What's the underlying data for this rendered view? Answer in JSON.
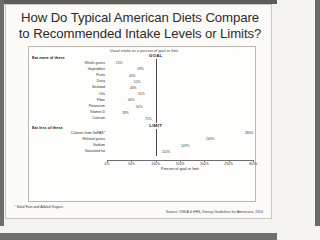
{
  "slide": {
    "title": "How Do Typical American Diets Compare to Recommended Intake Levels or Limits?",
    "axis_caption": "Usual intake as a percent of goal or limit",
    "footnote": "* Solid Fats and Added Sugars",
    "source": "Source: USDA & HHS, Dietary Guidelines for Americans, 2010"
  },
  "chart_data": {
    "type": "bar",
    "title": "How Do Typical American Diets Compare to Recommended Intake Levels or Limits?",
    "subtitle": "Usual intake as a percent of goal or limit",
    "orientation": "horizontal",
    "xlabel": "Percent of goal or limit",
    "ylabel": "",
    "xlim": [
      0,
      300
    ],
    "xticks": [
      0,
      50,
      100,
      150,
      200,
      250,
      300
    ],
    "xticklabels": [
      "0%",
      "50%",
      "100%",
      "150%",
      "200%",
      "250%",
      "300%"
    ],
    "grid": false,
    "legend": "none",
    "groups": [
      {
        "name": "Eat more of these",
        "reference_line": {
          "label": "GOAL",
          "value": 100
        },
        "categories": [
          "Whole grains",
          "Vegetables",
          "Fruits",
          "Dairy",
          "Seafood",
          "Oils",
          "Fiber",
          "Potassium",
          "Vitamin D",
          "Calcium"
        ],
        "values": [
          15,
          59,
          42,
          52,
          44,
          61,
          40,
          56,
          28,
          75
        ],
        "labels": [
          "15%",
          "59%",
          "42%",
          "52%",
          "44%",
          "61%",
          "40%",
          "56%",
          "28%",
          "75%"
        ]
      },
      {
        "name": "Eat less of these",
        "reference_line": {
          "label": "LIMIT",
          "value": 100
        },
        "categories": [
          "Calories from SoFAS*",
          "Refined grains",
          "Sodium",
          "Saturated fat"
        ],
        "values": [
          280,
          200,
          149,
          110
        ],
        "labels": [
          "280%",
          "200%",
          "149%",
          "110%"
        ]
      }
    ]
  }
}
